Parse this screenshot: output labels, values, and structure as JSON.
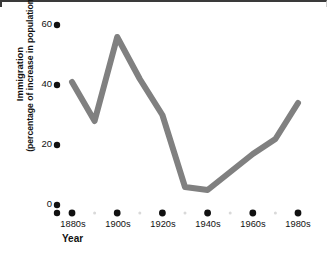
{
  "chart_data": {
    "type": "line",
    "title": "",
    "xlabel": "Year",
    "ylabel_line1": "Immigration",
    "ylabel_line2": "(percentage of increase in population)",
    "categories": [
      "1880s",
      "1890s",
      "1900s",
      "1910s",
      "1920s",
      "1930s",
      "1940s",
      "1950s",
      "1960s",
      "1970s",
      "1980s"
    ],
    "major_tick_labels": [
      "1880s",
      "1900s",
      "1920s",
      "1940s",
      "1960s",
      "1980s"
    ],
    "values": [
      41,
      28,
      56,
      42,
      30,
      6,
      5,
      11,
      17,
      22,
      34
    ],
    "ylim": [
      0,
      64
    ],
    "ytick_labels": [
      "0",
      "20",
      "40",
      "60"
    ],
    "ytick_values": [
      0,
      20,
      40,
      60
    ],
    "grid": false,
    "legend": "none",
    "series_color": "#808080",
    "tick_marker_color": "#111111",
    "minor_marker_color": "#d9d9d9"
  }
}
